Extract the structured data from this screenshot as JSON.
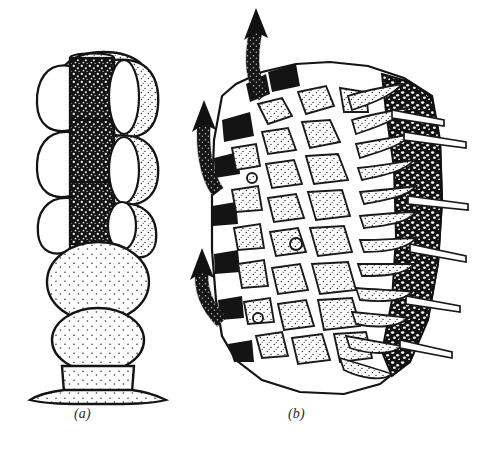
{
  "figure": {
    "kind": "scientific-line-illustration",
    "technique": "pen-and-ink stipple drawing",
    "background_color": "#ffffff",
    "ink_color": "#1a1a1a",
    "stipple_color": "#2b2b2b",
    "panel_count": 2,
    "captions": {
      "panel_a": "(a)",
      "panel_b": "(b)"
    },
    "panel_a": {
      "label": "(a)",
      "description": "Vertical multicellular filament shown in optical section",
      "orientation": "vertical",
      "segments_top_to_bottom": [
        {
          "name": "apical-dome-cell",
          "fill": "stipple",
          "shape": "rounded-cap"
        },
        {
          "name": "dark-granular-column-segment-1",
          "fill": "dense-granular",
          "shape": "rectangular"
        },
        {
          "name": "dark-granular-column-segment-2",
          "fill": "dense-granular",
          "shape": "rectangular"
        },
        {
          "name": "dark-granular-column-segment-3",
          "fill": "dense-granular",
          "shape": "rectangular"
        },
        {
          "name": "large-stippled-sphere-1",
          "fill": "stipple",
          "shape": "spherical"
        },
        {
          "name": "large-stippled-sphere-2",
          "fill": "stipple",
          "shape": "spherical"
        },
        {
          "name": "basal-cell",
          "fill": "stipple",
          "shape": "barrel"
        },
        {
          "name": "flared-basal-foot",
          "fill": "stipple",
          "shape": "flared-disc"
        }
      ],
      "lateral_cells": {
        "name": "white-oval-cells",
        "fill": "white",
        "count_left": 4,
        "count_right": 4,
        "note": "clear elliptical cells flanking the dark central column"
      }
    },
    "panel_b": {
      "label": "(b)",
      "description": "Sectional view of tissue mass with radiating cells, reticulate outer band and projecting needles",
      "zones_left_to_right": [
        {
          "name": "dark-marginal-blocks",
          "fill": "solid-dark",
          "note": "dark wedges along left contour"
        },
        {
          "name": "polygonal-stippled-cells",
          "fill": "stipple",
          "note": "irregular isodiametric cells in the interior"
        },
        {
          "name": "radiating-elongate-cells",
          "fill": "stipple",
          "note": "elongated cells fanning toward right margin"
        },
        {
          "name": "reticulate-dark-band",
          "fill": "dark-mesh",
          "note": "dark network band along right margin"
        }
      ],
      "arrows": {
        "name": "flow-arrows",
        "count": 3,
        "style": "thick curved stippled arrow with solid head",
        "direction": "upward, emerging from left margin",
        "positions": [
          "top",
          "middle",
          "lower"
        ]
      },
      "projections": {
        "name": "needle-projections",
        "count": 6,
        "direction": "outward to the right",
        "style": "slender double-lined spines"
      }
    }
  }
}
